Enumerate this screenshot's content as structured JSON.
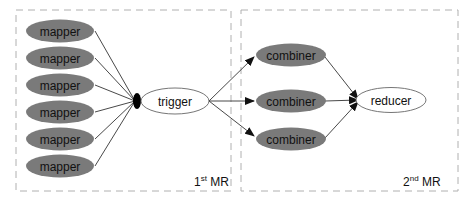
{
  "diagram": {
    "groups": [
      {
        "id": "mr1",
        "label_base": "1",
        "label_sup": "st",
        "label_rest": " MR"
      },
      {
        "id": "mr2",
        "label_base": "2",
        "label_sup": "nd",
        "label_rest": " MR"
      }
    ],
    "nodes": {
      "mappers": [
        "mapper",
        "mapper",
        "mapper",
        "mapper",
        "mapper",
        "mapper"
      ],
      "trigger": "trigger",
      "combiners": [
        "combiner",
        "combiner",
        "combiner"
      ],
      "reducer": "reducer"
    },
    "colors": {
      "filled_node": "#7a7a7a",
      "outline_node": "#666666",
      "edge": "#222222",
      "group_border": "#b0b0b0"
    }
  }
}
